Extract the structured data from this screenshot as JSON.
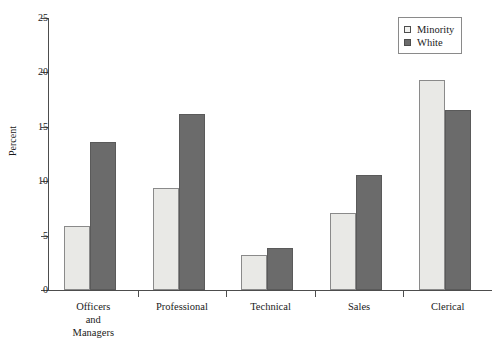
{
  "chart_data": {
    "type": "bar",
    "title": "",
    "subtitle": "",
    "xlabel": "",
    "ylabel": "Percent",
    "ylim": [
      0,
      25
    ],
    "yticks": [
      0,
      5,
      10,
      15,
      20,
      25
    ],
    "ytick_labels": [
      "0",
      "5",
      "10",
      "15",
      "20",
      "25"
    ],
    "grid": false,
    "legend_position": "top-right",
    "categories": [
      "Officers and Managers",
      "Professional",
      "Technical",
      "Sales",
      "Clerical"
    ],
    "category_label_lines": [
      [
        "Officers",
        "and",
        "Managers"
      ],
      [
        "Professional"
      ],
      [
        "Technical"
      ],
      [
        "Sales"
      ],
      [
        "Clerical"
      ]
    ],
    "series": [
      {
        "name": "Minority",
        "color": "#e9e9e6",
        "values": [
          5.9,
          9.4,
          3.2,
          7.1,
          19.3
        ]
      },
      {
        "name": "White",
        "color": "#6b6b6b",
        "values": [
          13.6,
          16.2,
          3.9,
          10.6,
          16.5
        ]
      }
    ]
  },
  "legend": {
    "items": [
      {
        "label": "Minority"
      },
      {
        "label": "White"
      }
    ]
  },
  "axis": {
    "y_title": "Percent"
  }
}
